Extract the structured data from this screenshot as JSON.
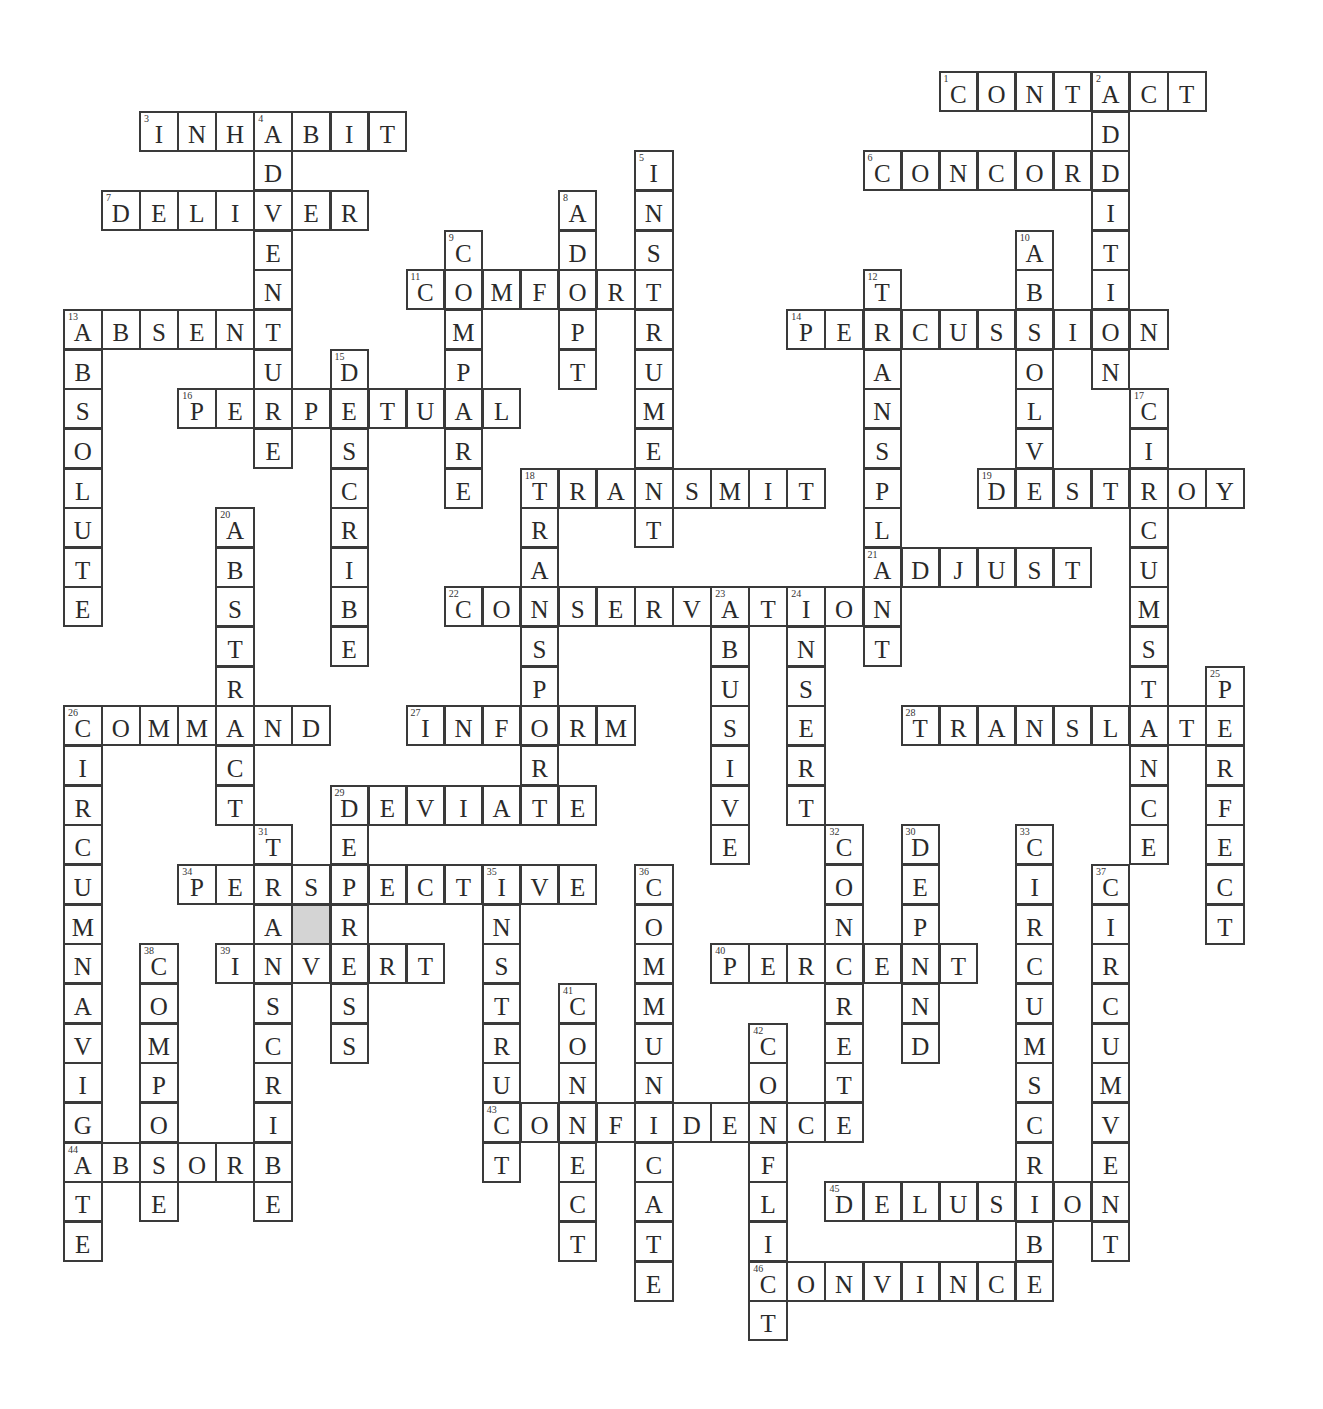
{
  "puzzle": {
    "grid": {
      "origin_x": 63,
      "origin_y": 71,
      "col_pitch": 38.07,
      "row_pitch": 39.65,
      "cols": 31,
      "rows": 32
    },
    "shaded_cells": [
      {
        "row": 21,
        "col": 6,
        "color": "#d4d4d4"
      }
    ],
    "words": [
      {
        "num": 1,
        "answer": "CONTACT",
        "dir": "across",
        "row": 0,
        "col": 23
      },
      {
        "num": 2,
        "answer": "ADDITION",
        "dir": "down",
        "row": 0,
        "col": 27
      },
      {
        "num": 3,
        "answer": "INHABIT",
        "dir": "across",
        "row": 1,
        "col": 2
      },
      {
        "num": 4,
        "answer": "ADVENTURE",
        "dir": "down",
        "row": 1,
        "col": 5
      },
      {
        "num": 5,
        "answer": "INSTRUMENT",
        "dir": "down",
        "row": 2,
        "col": 15
      },
      {
        "num": 6,
        "answer": "CONCORD",
        "dir": "across",
        "row": 2,
        "col": 21
      },
      {
        "num": 7,
        "answer": "DELIVER",
        "dir": "across",
        "row": 3,
        "col": 1
      },
      {
        "num": 8,
        "answer": "ADOPT",
        "dir": "down",
        "row": 3,
        "col": 13
      },
      {
        "num": 9,
        "answer": "COMPARE",
        "dir": "down",
        "row": 4,
        "col": 10
      },
      {
        "num": 10,
        "answer": "ABSOLVE",
        "dir": "down",
        "row": 4,
        "col": 25
      },
      {
        "num": 11,
        "answer": "COMFORT",
        "dir": "across",
        "row": 5,
        "col": 9
      },
      {
        "num": 12,
        "answer": "TRANSPLANT",
        "dir": "down",
        "row": 5,
        "col": 21
      },
      {
        "num": 13,
        "answer": "ABSENT",
        "dir": "across",
        "row": 6,
        "col": 0
      },
      {
        "num": 13,
        "answer": "ABSOLUTE",
        "dir": "down",
        "row": 6,
        "col": 0
      },
      {
        "num": 14,
        "answer": "PERCUSSION",
        "dir": "across",
        "row": 6,
        "col": 19
      },
      {
        "num": 15,
        "answer": "DESCRIBE",
        "dir": "down",
        "row": 7,
        "col": 7
      },
      {
        "num": 16,
        "answer": "PERPETUAL",
        "dir": "across",
        "row": 8,
        "col": 3
      },
      {
        "num": 17,
        "answer": "CIRCUMSTANCE",
        "dir": "down",
        "row": 8,
        "col": 28
      },
      {
        "num": 18,
        "answer": "TRANSMIT",
        "dir": "across",
        "row": 10,
        "col": 12
      },
      {
        "num": 18,
        "answer": "TRANSPORT",
        "dir": "down",
        "row": 10,
        "col": 12
      },
      {
        "num": 19,
        "answer": "DESTROY",
        "dir": "across",
        "row": 10,
        "col": 24
      },
      {
        "num": 20,
        "answer": "ABSTRACT",
        "dir": "down",
        "row": 11,
        "col": 4
      },
      {
        "num": 21,
        "answer": "ADJUST",
        "dir": "across",
        "row": 12,
        "col": 21
      },
      {
        "num": 22,
        "answer": "CONSERVATION",
        "dir": "across",
        "row": 13,
        "col": 10
      },
      {
        "num": 23,
        "answer": "ABUSIVE",
        "dir": "down",
        "row": 13,
        "col": 17
      },
      {
        "num": 24,
        "answer": "INSERT",
        "dir": "down",
        "row": 13,
        "col": 19
      },
      {
        "num": 25,
        "answer": "PERFECT",
        "dir": "down",
        "row": 15,
        "col": 30
      },
      {
        "num": 26,
        "answer": "COMMAND",
        "dir": "across",
        "row": 16,
        "col": 0
      },
      {
        "num": 26,
        "answer": "CIRCUMNAVIGATE",
        "dir": "down",
        "row": 16,
        "col": 0
      },
      {
        "num": 27,
        "answer": "INFORM",
        "dir": "across",
        "row": 16,
        "col": 9
      },
      {
        "num": 28,
        "answer": "TRANSLATE",
        "dir": "across",
        "row": 16,
        "col": 22
      },
      {
        "num": 29,
        "answer": "DEVIATE",
        "dir": "across",
        "row": 18,
        "col": 7
      },
      {
        "num": 29,
        "answer": "DEPRESS",
        "dir": "down",
        "row": 18,
        "col": 7
      },
      {
        "num": 30,
        "answer": "DEPEND",
        "dir": "down",
        "row": 19,
        "col": 22
      },
      {
        "num": 31,
        "answer": "TRANSCRIBE",
        "dir": "down",
        "row": 19,
        "col": 5
      },
      {
        "num": 32,
        "answer": "CONCRETE",
        "dir": "down",
        "row": 19,
        "col": 20
      },
      {
        "num": 33,
        "answer": "CIRCUMSCRIBE",
        "dir": "down",
        "row": 19,
        "col": 25
      },
      {
        "num": 34,
        "answer": "PERSPECTIVE",
        "dir": "across",
        "row": 20,
        "col": 3
      },
      {
        "num": 35,
        "answer": "INSTRUCT",
        "dir": "down",
        "row": 20,
        "col": 11
      },
      {
        "num": 36,
        "answer": "COMMUNICATE",
        "dir": "down",
        "row": 20,
        "col": 15
      },
      {
        "num": 37,
        "answer": "CIRCUMVENT",
        "dir": "down",
        "row": 20,
        "col": 27
      },
      {
        "num": 38,
        "answer": "COMPOSE",
        "dir": "down",
        "row": 22,
        "col": 2
      },
      {
        "num": 39,
        "answer": "INVERT",
        "dir": "across",
        "row": 22,
        "col": 4
      },
      {
        "num": 40,
        "answer": "PERCENT",
        "dir": "across",
        "row": 22,
        "col": 17
      },
      {
        "num": 41,
        "answer": "CONNECT",
        "dir": "down",
        "row": 23,
        "col": 13
      },
      {
        "num": 42,
        "answer": "CONFLICT",
        "dir": "down",
        "row": 24,
        "col": 18
      },
      {
        "num": 43,
        "answer": "CONFIDENCE",
        "dir": "across",
        "row": 26,
        "col": 11
      },
      {
        "num": 44,
        "answer": "ABSORB",
        "dir": "across",
        "row": 27,
        "col": 0
      },
      {
        "num": 45,
        "answer": "DELUSION",
        "dir": "across",
        "row": 28,
        "col": 20
      },
      {
        "num": 46,
        "answer": "CONVINCE",
        "dir": "across",
        "row": 30,
        "col": 18
      }
    ]
  }
}
